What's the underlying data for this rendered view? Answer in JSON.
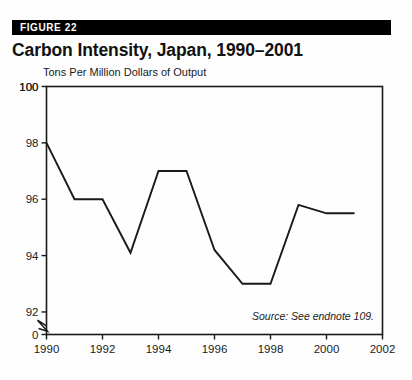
{
  "figure": {
    "banner_label": "FIGURE 22",
    "title": "Carbon Intensity, Japan, 1990–2001",
    "source_note": "Source: See endnote 109."
  },
  "chart_data": {
    "type": "line",
    "title": "Carbon Intensity, Japan, 1990–2001",
    "xlabel": "",
    "ylabel": "Tons Per Million Dollars of Output",
    "x": [
      1990,
      1991,
      1992,
      1993,
      1994,
      1995,
      1996,
      1997,
      1998,
      1999,
      2000,
      2001
    ],
    "values": [
      98.0,
      96.0,
      96.0,
      94.1,
      97.0,
      97.0,
      94.2,
      93.0,
      93.0,
      95.8,
      95.5,
      95.5
    ],
    "xlim": [
      1990,
      2002
    ],
    "ylim": [
      91.2,
      100
    ],
    "xticks": [
      1990,
      1992,
      1994,
      1996,
      1998,
      2000,
      2002
    ],
    "xtick_labels": [
      "1990",
      "1992",
      "1994",
      "1996",
      "1998",
      "2000",
      "2002"
    ],
    "yticks": [
      92,
      94,
      96,
      98,
      100
    ],
    "ytick_labels": [
      "92",
      "94",
      "96",
      "98",
      "100"
    ],
    "y_origin_label": "0",
    "axis_break": true,
    "grid": false,
    "legend": false,
    "line_color": "#1a1a1a",
    "frame_color": "#1a1a1a"
  }
}
